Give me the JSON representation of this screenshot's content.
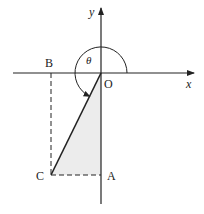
{
  "diagram": {
    "axes": {
      "x_label": "x",
      "y_label": "y"
    },
    "points": {
      "origin": "O",
      "A": "A",
      "B": "B",
      "C": "C"
    },
    "angle_label": "θ",
    "colors": {
      "line": "#222222",
      "shade": "#ececec",
      "background": "#ffffff"
    }
  }
}
